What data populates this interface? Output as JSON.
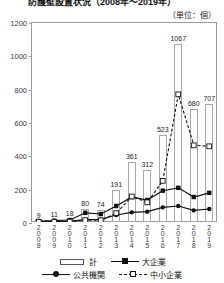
{
  "title": "防護壁設置状況（2008年～2019年）",
  "unit_label": "（単位：個）",
  "legend": {
    "items": [
      {
        "label": "計",
        "marker": "bar-box"
      },
      {
        "label": "大企業",
        "marker": "line-filled-square"
      },
      {
        "label": "公共機関",
        "marker": "line-filled-circle"
      },
      {
        "label": "中小企業",
        "marker": "dashed-open-square"
      }
    ]
  },
  "chart_data": {
    "type": "bar",
    "title": "防護壁設置状況（2008年～2019年）",
    "xlabel": "",
    "ylabel": "",
    "unit": "個",
    "ylim": [
      0,
      1200
    ],
    "yticks": [
      0,
      200,
      400,
      600,
      800,
      1000,
      1200
    ],
    "grid": false,
    "legend_position": "bottom",
    "categories": [
      "2008",
      "2009",
      "2010",
      "2011",
      "2012",
      "2013",
      "2014",
      "2015",
      "2016",
      "2017",
      "2018",
      "2019"
    ],
    "series": [
      {
        "name": "計",
        "type": "bar",
        "values": [
          9,
          11,
          18,
          80,
          74,
          191,
          361,
          312,
          523,
          1067,
          680,
          707
        ],
        "labels": [
          "9",
          "11",
          "18",
          "80",
          "74",
          "191",
          "361",
          "312",
          "523",
          "1067",
          "680",
          "707"
        ]
      },
      {
        "name": "大企業",
        "type": "line",
        "marker": "filled-square",
        "values": [
          6,
          8,
          12,
          55,
          48,
          96,
          150,
          132,
          188,
          205,
          150,
          175
        ]
      },
      {
        "name": "公共機関",
        "type": "line",
        "marker": "filled-circle",
        "values": [
          2,
          2,
          4,
          14,
          16,
          42,
          58,
          62,
          88,
          96,
          70,
          78
        ]
      },
      {
        "name": "中小企業",
        "type": "line",
        "marker": "open-square",
        "style": "dashed",
        "values": [
          1,
          1,
          2,
          11,
          10,
          53,
          153,
          118,
          247,
          766,
          460,
          454
        ]
      }
    ]
  }
}
